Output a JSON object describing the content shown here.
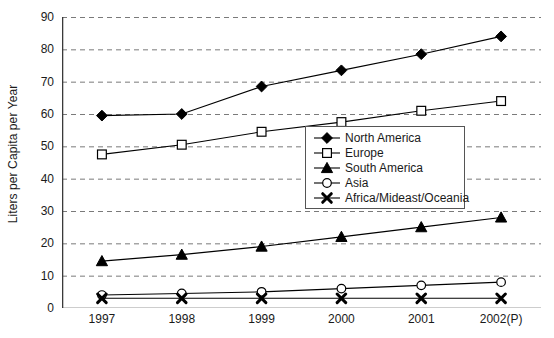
{
  "chart_data": {
    "type": "line",
    "title": "",
    "xlabel": "",
    "ylabel": "Liters per Capita per Year",
    "categories": [
      "1997",
      "1998",
      "1999",
      "2000",
      "2001",
      "2002(P)"
    ],
    "ylim": [
      0,
      90
    ],
    "yticks": [
      0,
      10,
      20,
      30,
      40,
      50,
      60,
      70,
      80,
      90
    ],
    "grid": "horizontal-dashed",
    "legend_position": "center-right",
    "series": [
      {
        "name": "North America",
        "marker": "filled-diamond",
        "values": [
          59.5,
          60,
          68.5,
          73.5,
          78.5,
          84
        ]
      },
      {
        "name": "Europe",
        "marker": "open-square",
        "values": [
          47.5,
          50.5,
          54.5,
          57.5,
          61,
          64
        ]
      },
      {
        "name": "South America",
        "marker": "filled-triangle",
        "values": [
          14.5,
          16.5,
          19,
          22,
          25,
          28
        ]
      },
      {
        "name": "Asia",
        "marker": "open-circle",
        "values": [
          4,
          4.5,
          5,
          6,
          7,
          8
        ]
      },
      {
        "name": "Africa/Mideast/Oceania",
        "marker": "x-cross",
        "values": [
          3,
          3,
          3,
          3,
          3,
          3
        ]
      }
    ]
  },
  "colors": {
    "axis": "#3a3a3a",
    "grid": "#7a7a7a",
    "series": "#000000",
    "background": "#ffffff",
    "legend_border": "#555555"
  }
}
